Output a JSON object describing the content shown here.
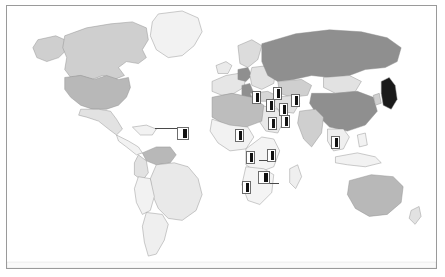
{
  "figure": {
    "type": "choropleth-map-with-markers",
    "frame_border_color": "#9a9a9a",
    "background_color": "#ffffff"
  },
  "legend_shading": {
    "ocean": "#ffffff",
    "no_data": "#f2f2f2",
    "light": "#e2e2e2",
    "medium_light": "#cfcfcf",
    "medium": "#b8b8b8",
    "dark": "#8f8f8f",
    "darkest": "#1a1a1a"
  },
  "regions": [
    {
      "name": "Canada",
      "shade": "medium_light"
    },
    {
      "name": "United States",
      "shade": "medium"
    },
    {
      "name": "Mexico",
      "shade": "light"
    },
    {
      "name": "Greenland",
      "shade": "no_data"
    },
    {
      "name": "Alaska",
      "shade": "medium_light"
    },
    {
      "name": "Brazil",
      "shade": "light"
    },
    {
      "name": "Venezuela",
      "shade": "medium"
    },
    {
      "name": "Colombia",
      "shade": "light"
    },
    {
      "name": "Argentina",
      "shade": "light"
    },
    {
      "name": "Western Europe",
      "shade": "light"
    },
    {
      "name": "Germany",
      "shade": "dark"
    },
    {
      "name": "Italy",
      "shade": "dark"
    },
    {
      "name": "Russia",
      "shade": "dark"
    },
    {
      "name": "Mongolia",
      "shade": "light"
    },
    {
      "name": "China",
      "shade": "dark"
    },
    {
      "name": "India",
      "shade": "medium_light"
    },
    {
      "name": "Japan",
      "shade": "darkest"
    },
    {
      "name": "Kazakhstan",
      "shade": "medium_light"
    },
    {
      "name": "Saudi Arabia",
      "shade": "light"
    },
    {
      "name": "Egypt",
      "shade": "medium"
    },
    {
      "name": "Libya",
      "shade": "medium"
    },
    {
      "name": "Algeria",
      "shade": "medium"
    },
    {
      "name": "Sub-Saharan Africa",
      "shade": "no_data"
    },
    {
      "name": "Australia",
      "shade": "medium"
    },
    {
      "name": "New Zealand",
      "shade": "light"
    }
  ],
  "markers": [
    {
      "id": "m01",
      "label": "",
      "region": "Venezuela",
      "x": 176,
      "y": 128,
      "style": "wide",
      "leader": {
        "to_x": 148,
        "to_y": 121
      }
    },
    {
      "id": "m02",
      "label": "",
      "region": "West Africa",
      "x": 232,
      "y": 130,
      "style": "normal",
      "leader": null
    },
    {
      "id": "m03",
      "label": "",
      "region": "Turkey",
      "x": 249,
      "y": 92,
      "style": "normal",
      "leader": null
    },
    {
      "id": "m04",
      "label": "",
      "region": "Iran",
      "x": 270,
      "y": 88,
      "style": "normal",
      "leader": null
    },
    {
      "id": "m05",
      "label": "",
      "region": "Israel",
      "x": 263,
      "y": 100,
      "style": "normal",
      "leader": null
    },
    {
      "id": "m06",
      "label": "",
      "region": "Saudi Arabia",
      "x": 276,
      "y": 104,
      "style": "normal",
      "leader": null
    },
    {
      "id": "m07",
      "label": "",
      "region": "Pakistan",
      "x": 288,
      "y": 95,
      "style": "normal",
      "leader": null
    },
    {
      "id": "m08",
      "label": "",
      "region": "Gulf States",
      "x": 278,
      "y": 116,
      "style": "normal",
      "leader": null
    },
    {
      "id": "m09",
      "label": "",
      "region": "Yemen",
      "x": 265,
      "y": 118,
      "style": "normal",
      "leader": null
    },
    {
      "id": "m10",
      "label": "",
      "region": "Thailand",
      "x": 328,
      "y": 137,
      "style": "normal",
      "leader": null
    },
    {
      "id": "m11",
      "label": "",
      "region": "Kenya",
      "x": 264,
      "y": 150,
      "style": "normal",
      "leader": {
        "to_x": 252,
        "to_y": 153
      }
    },
    {
      "id": "m12",
      "label": "",
      "region": "Cameroon",
      "x": 243,
      "y": 152,
      "style": "normal",
      "leader": null
    },
    {
      "id": "m13",
      "label": "",
      "region": "Zambia",
      "x": 257,
      "y": 172,
      "style": "wide",
      "leader": {
        "to_x": 266,
        "to_y": 176
      }
    },
    {
      "id": "m14",
      "label": "",
      "region": "Namibia",
      "x": 239,
      "y": 182,
      "style": "normal",
      "leader": null
    }
  ]
}
